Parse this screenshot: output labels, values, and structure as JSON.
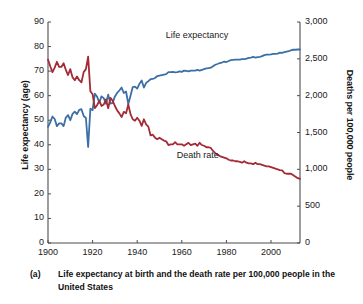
{
  "caption": {
    "marker": "(a)",
    "text": "Life expectancy at birth and the death rate per 100,000 people in the United States"
  },
  "chart_data": {
    "type": "line",
    "title": "",
    "xlabel": "",
    "ylabel": "Life expectancy (age)",
    "ylabel_right": "Deaths per 100,000 people",
    "xlim": [
      1900,
      2013
    ],
    "ylim": [
      0,
      90
    ],
    "ylim_right": [
      0,
      3000
    ],
    "grid": false,
    "legend_position": "inline-annotations",
    "xticks": [
      1900,
      1920,
      1940,
      1960,
      1980,
      2000
    ],
    "xtick_labels": [
      "1900",
      "1920",
      "1940",
      "1960",
      "1980",
      "2000"
    ],
    "yticks": [
      0,
      10,
      20,
      30,
      40,
      50,
      60,
      70,
      80,
      90
    ],
    "ytick_labels": [
      "0",
      "10",
      "20",
      "30",
      "40",
      "50",
      "60",
      "70",
      "80",
      "90"
    ],
    "yticks_right": [
      0,
      500,
      1000,
      1500,
      2000,
      2500,
      3000
    ],
    "ytick_labels_right": [
      "0",
      "500",
      "1,000",
      "1,500",
      "2,000",
      "2,500",
      "3,000"
    ],
    "annotations": [
      {
        "name": "life-expectancy-label",
        "text": "Life expectancy",
        "x": 1968,
        "y": 84.5
      },
      {
        "name": "death-rate-label",
        "text": "Death rate",
        "x": 1973,
        "y": 35.5
      }
    ],
    "series": [
      {
        "name": "Life expectancy",
        "axis": "left",
        "color": "#3c6fa6",
        "unit": "years",
        "x": [
          1900,
          1901,
          1902,
          1903,
          1904,
          1905,
          1906,
          1907,
          1908,
          1909,
          1910,
          1911,
          1912,
          1913,
          1914,
          1915,
          1916,
          1917,
          1918,
          1919,
          1920,
          1921,
          1922,
          1923,
          1924,
          1925,
          1926,
          1927,
          1928,
          1929,
          1930,
          1931,
          1932,
          1933,
          1934,
          1935,
          1936,
          1937,
          1938,
          1939,
          1940,
          1941,
          1942,
          1943,
          1944,
          1945,
          1946,
          1947,
          1948,
          1949,
          1950,
          1951,
          1952,
          1953,
          1954,
          1955,
          1956,
          1957,
          1958,
          1959,
          1960,
          1961,
          1962,
          1963,
          1964,
          1965,
          1966,
          1967,
          1968,
          1969,
          1970,
          1971,
          1972,
          1973,
          1974,
          1975,
          1976,
          1977,
          1978,
          1979,
          1980,
          1981,
          1982,
          1983,
          1984,
          1985,
          1986,
          1987,
          1988,
          1989,
          1990,
          1991,
          1992,
          1993,
          1994,
          1995,
          1996,
          1997,
          1998,
          1999,
          2000,
          2001,
          2002,
          2003,
          2004,
          2005,
          2006,
          2007,
          2008,
          2009,
          2010,
          2011,
          2012,
          2013
        ],
        "values": [
          47.3,
          49.1,
          51.5,
          50.5,
          47.6,
          48.7,
          48.7,
          47.6,
          51.1,
          52.1,
          50.0,
          52.6,
          53.5,
          52.5,
          54.2,
          54.5,
          51.7,
          50.9,
          39.1,
          54.7,
          54.1,
          60.8,
          59.6,
          57.2,
          59.7,
          59.0,
          56.7,
          60.4,
          56.8,
          57.1,
          59.7,
          61.1,
          62.1,
          63.3,
          61.1,
          61.7,
          56.6,
          60.0,
          63.5,
          63.7,
          62.9,
          64.8,
          66.2,
          63.3,
          65.2,
          65.9,
          66.7,
          66.8,
          67.2,
          68.0,
          68.2,
          68.4,
          68.6,
          68.8,
          69.6,
          69.6,
          69.7,
          69.5,
          69.6,
          69.9,
          69.7,
          70.2,
          70.1,
          69.9,
          70.2,
          70.2,
          70.2,
          70.5,
          70.2,
          70.5,
          70.8,
          71.1,
          71.2,
          71.4,
          72.0,
          72.6,
          72.9,
          73.3,
          73.5,
          73.9,
          73.7,
          74.1,
          74.5,
          74.6,
          74.7,
          74.7,
          74.7,
          74.9,
          74.9,
          75.1,
          75.4,
          75.5,
          75.8,
          75.5,
          75.7,
          75.8,
          76.1,
          76.5,
          76.7,
          76.7,
          76.8,
          77.0,
          77.0,
          77.1,
          77.5,
          77.4,
          77.7,
          77.9,
          78.1,
          78.5,
          78.7,
          78.7,
          78.8,
          78.8
        ]
      },
      {
        "name": "Death rate",
        "axis": "right",
        "color": "#a32b35",
        "unit": "deaths per 100,000 people",
        "x": [
          1900,
          1901,
          1902,
          1903,
          1904,
          1905,
          1906,
          1907,
          1908,
          1909,
          1910,
          1911,
          1912,
          1913,
          1914,
          1915,
          1916,
          1917,
          1918,
          1919,
          1920,
          1921,
          1922,
          1923,
          1924,
          1925,
          1926,
          1927,
          1928,
          1929,
          1930,
          1931,
          1932,
          1933,
          1934,
          1935,
          1936,
          1937,
          1938,
          1939,
          1940,
          1941,
          1942,
          1943,
          1944,
          1945,
          1946,
          1947,
          1948,
          1949,
          1950,
          1951,
          1952,
          1953,
          1954,
          1955,
          1956,
          1957,
          1958,
          1959,
          1960,
          1961,
          1962,
          1963,
          1964,
          1965,
          1966,
          1967,
          1968,
          1969,
          1970,
          1971,
          1972,
          1973,
          1974,
          1975,
          1976,
          1977,
          1978,
          1979,
          1980,
          1981,
          1982,
          1983,
          1984,
          1985,
          1986,
          1987,
          1988,
          1989,
          1990,
          1991,
          1992,
          1993,
          1994,
          1995,
          1996,
          1997,
          1998,
          1999,
          2000,
          2001,
          2002,
          2003,
          2004,
          2005,
          2006,
          2007,
          2008,
          2009,
          2010,
          2011,
          2012,
          2013
        ],
        "values": [
          2490,
          2400,
          2320,
          2380,
          2460,
          2390,
          2390,
          2440,
          2350,
          2280,
          2360,
          2250,
          2210,
          2260,
          2210,
          2180,
          2320,
          2360,
          2530,
          2060,
          2020,
          1830,
          1870,
          1930,
          1860,
          1880,
          1950,
          1830,
          1970,
          1930,
          1860,
          1800,
          1760,
          1710,
          1780,
          1760,
          1880,
          1750,
          1680,
          1660,
          1700,
          1660,
          1590,
          1680,
          1610,
          1580,
          1460,
          1470,
          1430,
          1410,
          1430,
          1410,
          1390,
          1380,
          1330,
          1340,
          1340,
          1370,
          1340,
          1340,
          1340,
          1320,
          1340,
          1360,
          1330,
          1340,
          1350,
          1320,
          1360,
          1330,
          1320,
          1300,
          1300,
          1290,
          1250,
          1220,
          1200,
          1180,
          1170,
          1160,
          1150,
          1130,
          1120,
          1120,
          1110,
          1110,
          1100,
          1090,
          1110,
          1090,
          1080,
          1080,
          1070,
          1090,
          1070,
          1070,
          1060,
          1050,
          1040,
          1040,
          1030,
          1020,
          1010,
          1000,
          990,
          985,
          950,
          940,
          940,
          940,
          920,
          900,
          880,
          870
        ]
      }
    ]
  }
}
